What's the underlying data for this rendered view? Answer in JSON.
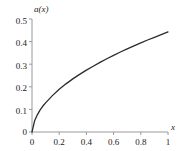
{
  "chart_data": {
    "type": "line",
    "title": "",
    "subtitle": "",
    "xlabel": "x",
    "ylabel": "a(x)",
    "xlim": [
      0,
      1
    ],
    "ylim": [
      0,
      0.5
    ],
    "grid": false,
    "legend": null,
    "x_ticks": [
      "0",
      "0.2",
      "0.4",
      "0.6",
      "0.8",
      "1"
    ],
    "x_tick_values": [
      0,
      0.2,
      0.4,
      0.6,
      0.8,
      1
    ],
    "y_ticks": [
      "0",
      "0.1",
      "0.2",
      "0.3",
      "0.4",
      "0.5"
    ],
    "y_tick_values": [
      0,
      0.1,
      0.2,
      0.3,
      0.4,
      0.5
    ],
    "series": [
      {
        "name": "a(x)",
        "color": "#2b2b2b",
        "line_width": 1.3,
        "x": [
          0,
          0.02,
          0.04,
          0.06,
          0.08,
          0.1,
          0.15,
          0.2,
          0.25,
          0.3,
          0.35,
          0.4,
          0.45,
          0.5,
          0.55,
          0.6,
          0.65,
          0.7,
          0.75,
          0.8,
          0.85,
          0.9,
          0.95,
          1
        ],
        "values": [
          0,
          0.051,
          0.077,
          0.098,
          0.115,
          0.129,
          0.161,
          0.189,
          0.213,
          0.235,
          0.255,
          0.274,
          0.291,
          0.308,
          0.324,
          0.339,
          0.354,
          0.368,
          0.381,
          0.394,
          0.407,
          0.419,
          0.431,
          0.443
        ]
      }
    ],
    "axis_color": "#9a9a9a",
    "tick_color": "#9a9a9a",
    "text_color": "#1a1a1a",
    "background": "#ffffff"
  },
  "labels": {
    "y_axis_name": "a(x)",
    "x_axis_name": "x",
    "x0": "0",
    "x1": "0.2",
    "x2": "0.4",
    "x3": "0.6",
    "x4": "0.8",
    "x5": "1",
    "y0": "0",
    "y1": "0.1",
    "y2": "0.2",
    "y3": "0.3",
    "y4": "0.4",
    "y5": "0.5"
  }
}
